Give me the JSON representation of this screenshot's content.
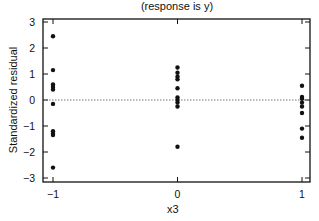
{
  "chart_data": {
    "type": "scatter",
    "title": "(response is y)",
    "xlabel": "x3",
    "ylabel": "Standardized residual",
    "xlim": [
      -1.08,
      1.06
    ],
    "ylim": [
      -3.1,
      3.1
    ],
    "xticks": [
      -1,
      0,
      1
    ],
    "yticks": [
      3,
      2,
      1,
      0,
      -1,
      -2,
      -3
    ],
    "reference_line": {
      "y": 0,
      "style": "dotted"
    },
    "grid": false,
    "legend": null,
    "series": [
      {
        "name": "residuals",
        "points": [
          {
            "x": -1,
            "y": 2.45
          },
          {
            "x": -1,
            "y": 1.15
          },
          {
            "x": -1,
            "y": 0.6
          },
          {
            "x": -1,
            "y": 0.5
          },
          {
            "x": -1,
            "y": 0.4
          },
          {
            "x": -1,
            "y": -0.15
          },
          {
            "x": -1,
            "y": -1.2
          },
          {
            "x": -1,
            "y": -1.3
          },
          {
            "x": -1,
            "y": -1.35
          },
          {
            "x": -1,
            "y": -2.6
          },
          {
            "x": 0,
            "y": 1.25
          },
          {
            "x": 0,
            "y": 1.05
          },
          {
            "x": 0,
            "y": 0.9
          },
          {
            "x": 0,
            "y": 0.8
          },
          {
            "x": 0,
            "y": 0.45
          },
          {
            "x": 0,
            "y": 0.1
          },
          {
            "x": 0,
            "y": 0.0
          },
          {
            "x": 0,
            "y": -0.1
          },
          {
            "x": 0,
            "y": -0.25
          },
          {
            "x": 0,
            "y": -1.8
          },
          {
            "x": 1,
            "y": 0.55
          },
          {
            "x": 1,
            "y": 0.12
          },
          {
            "x": 1,
            "y": 0.05
          },
          {
            "x": 1,
            "y": -0.1
          },
          {
            "x": 1,
            "y": -0.25
          },
          {
            "x": 1,
            "y": -0.5
          },
          {
            "x": 1,
            "y": -1.1
          },
          {
            "x": 1,
            "y": -1.45
          }
        ]
      }
    ]
  },
  "colors": {
    "axis": "#111111",
    "points": "#111111",
    "refline": "#555555"
  }
}
